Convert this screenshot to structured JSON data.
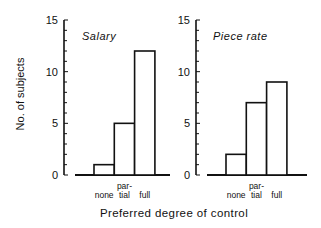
{
  "chart_data": [
    {
      "type": "bar",
      "title": "Salary",
      "categories": [
        "none",
        "partial",
        "full"
      ],
      "category_labels": [
        [
          "",
          "none"
        ],
        [
          "par-",
          "tial"
        ],
        [
          "",
          "full"
        ]
      ],
      "values": [
        1,
        5,
        12
      ],
      "ylabel": "No. of subjects",
      "xlabel": "Preferred degree of control",
      "ylim": [
        0,
        15
      ],
      "yticks": [
        0,
        5,
        10,
        15
      ],
      "minor_tick_step": 1,
      "grid": false,
      "legend": null
    },
    {
      "type": "bar",
      "title": "Piece rate",
      "categories": [
        "none",
        "partial",
        "full"
      ],
      "category_labels": [
        [
          "",
          "none"
        ],
        [
          "par-",
          "tial"
        ],
        [
          "",
          "full"
        ]
      ],
      "values": [
        2,
        7,
        9
      ],
      "ylabel": "No. of subjects",
      "xlabel": "Preferred degree of control",
      "ylim": [
        0,
        15
      ],
      "yticks": [
        0,
        5,
        10,
        15
      ],
      "minor_tick_step": 1,
      "grid": false,
      "legend": null
    }
  ],
  "labels": {
    "ylabel": "No. of subjects",
    "xlabel": "Preferred degree of control",
    "panel1_title": "Salary",
    "panel2_title": "Piece rate",
    "tick_0": "0",
    "tick_5": "5",
    "tick_10": "10",
    "tick_15": "15",
    "cat_par": "par-",
    "cat_bottom": "none tial full"
  }
}
